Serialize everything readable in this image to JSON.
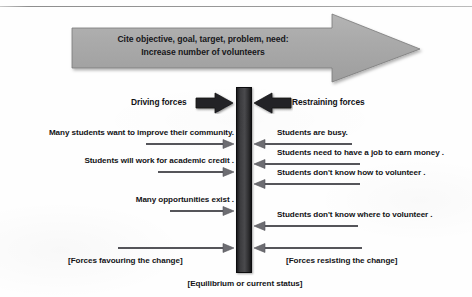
{
  "diagram": {
    "title_arrow": {
      "line1": "Cite objective, goal, target, problem, need:",
      "line2": "Increase number of volunteers"
    },
    "headers": {
      "driving": "Driving forces",
      "restraining": "Restraining forces"
    },
    "driving_forces": [
      {
        "label": "Many students want to improve their community.",
        "arrow_start_x": 147,
        "y": 142
      },
      {
        "label": "Students will work for academic credit .",
        "arrow_start_x": 159,
        "y": 170
      },
      {
        "label": "Many opportunities exist .",
        "arrow_start_x": 171,
        "y": 209
      },
      {
        "label": "",
        "arrow_start_x": 119,
        "y": 246
      }
    ],
    "restraining_forces": [
      {
        "label": "Students are busy.",
        "arrow_end_x": 352,
        "y": 142
      },
      {
        "label": "Students need to have a job to earn money .",
        "arrow_end_x": 360,
        "y": 162
      },
      {
        "label": "Students don't know how to volunteer .",
        "arrow_end_x": 360,
        "y": 182
      },
      {
        "label": "Students don't know where to volunteer .",
        "arrow_end_x": 358,
        "y": 224
      },
      {
        "label": "",
        "arrow_end_x": 362,
        "y": 246
      }
    ],
    "brackets": {
      "left": "[Forces favouring the change]",
      "right": "[Forces resisting the change]",
      "equilibrium": "[Equilibrium or current status]"
    },
    "colors": {
      "big_arrow_fill": "#a9a9a9",
      "big_arrow_edge": "#6e6e6e",
      "center_bar": "#3a3a3d",
      "block_arrow": "#232326",
      "thin_arrow": "#58585c",
      "text": "#121215"
    }
  }
}
